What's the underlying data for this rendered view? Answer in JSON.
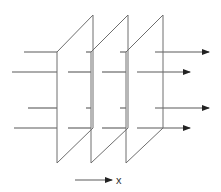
{
  "diagram": {
    "axis_label": "x",
    "colors": {
      "stroke": "#6e6e6e",
      "ray": "#5a5a5a",
      "background": "#ffffff"
    },
    "planes": [
      {
        "front_x": 57,
        "back_x": 93
      },
      {
        "front_x": 91,
        "back_x": 128
      },
      {
        "front_x": 126,
        "back_x": 163
      }
    ],
    "rays": [
      {
        "y": 52,
        "start_x": 24,
        "end_x": 209
      },
      {
        "y": 72,
        "start_x": 12,
        "end_x": 190
      },
      {
        "y": 108,
        "start_x": 28,
        "end_x": 209
      },
      {
        "y": 128,
        "start_x": 14,
        "end_x": 190
      }
    ]
  }
}
